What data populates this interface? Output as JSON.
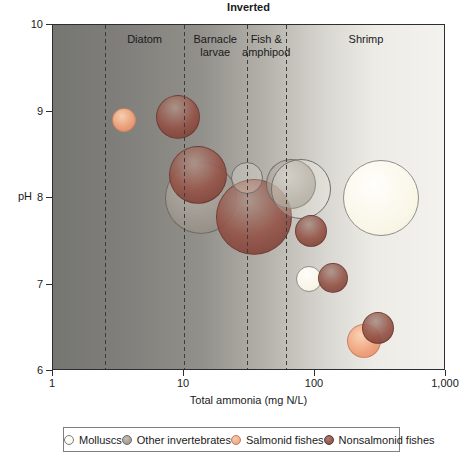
{
  "figure": {
    "title": "Inverted",
    "x_axis": {
      "label": "Total ammonia (mg N/L)",
      "scale": "log",
      "range": [
        1,
        1000
      ],
      "ticks": [
        {
          "value": 1,
          "label": "1"
        },
        {
          "value": 10,
          "label": "10"
        },
        {
          "value": 100,
          "label": "100"
        },
        {
          "value": 1000,
          "label": "1,000"
        }
      ]
    },
    "y_axis": {
      "label": "pH",
      "range": [
        6,
        10
      ],
      "ticks": [
        {
          "value": 10,
          "label": "10"
        },
        {
          "value": 9,
          "label": "9"
        },
        {
          "value": 8,
          "label": "8"
        },
        {
          "value": 7,
          "label": "7"
        },
        {
          "value": 6,
          "label": "6"
        }
      ]
    },
    "legend": {
      "items": [
        {
          "key": "mollusc",
          "label": "Molluscs"
        },
        {
          "key": "other",
          "label": "Other invertebrates"
        },
        {
          "key": "salmonid",
          "label": "Salmonid fishes"
        },
        {
          "key": "nonsalmonid",
          "label": "Nonsalmonid fishes"
        }
      ]
    },
    "colors": {
      "mollusc": "#fdfbef",
      "other": "#a09890",
      "salmonid": "#ee9d76",
      "nonsalmonid": "#8c4a42",
      "background_left": "#757571",
      "background_right": "#f3f2ee",
      "boundary_line": "#3c3c3c"
    }
  },
  "chart_data": {
    "type": "scatter",
    "title": "Inverted",
    "xlabel": "Total ammonia (mg N/L)",
    "ylabel": "pH",
    "x_scale": "log",
    "xlim": [
      1,
      1000
    ],
    "ylim": [
      6,
      10
    ],
    "grid": false,
    "legend_position": "bottom",
    "region_boundaries": [
      2.5,
      10,
      30,
      60
    ],
    "regions": [
      {
        "label": "Diatom",
        "from": 2.5,
        "to": 10
      },
      {
        "label": "Barnacle larvae",
        "from": 10,
        "to": 30
      },
      {
        "label": "Fish & amphipod",
        "from": 30,
        "to": 60
      },
      {
        "label": "Shrimp",
        "from": 60,
        "to": 1000
      }
    ],
    "series": [
      {
        "name": "Molluscs",
        "key": "mollusc",
        "points": [
          {
            "x": 30,
            "y": 8.23,
            "r_px": 16,
            "outline": true,
            "z": 5
          },
          {
            "x": 78,
            "y": 8.1,
            "r_px": 30,
            "outline": true,
            "z": 6
          },
          {
            "x": 320,
            "y": 8.0,
            "r_px": 38,
            "z": 10
          },
          {
            "x": 90,
            "y": 7.06,
            "r_px": 13,
            "z": 11
          }
        ]
      },
      {
        "name": "Other invertebrates",
        "key": "other",
        "points": [
          {
            "x": 13.5,
            "y": 8.0,
            "r_px": 36,
            "z": 1
          },
          {
            "x": 66,
            "y": 8.16,
            "r_px": 25,
            "z": 4
          }
        ]
      },
      {
        "name": "Salmonid fishes",
        "key": "salmonid",
        "points": [
          {
            "x": 3.5,
            "y": 8.9,
            "r_px": 12,
            "z": 8
          },
          {
            "x": 237,
            "y": 6.35,
            "r_px": 17,
            "z": 13
          }
        ]
      },
      {
        "name": "Nonsalmonid fishes",
        "key": "nonsalmonid",
        "points": [
          {
            "x": 12.8,
            "y": 8.27,
            "r_px": 29,
            "z": 2
          },
          {
            "x": 34,
            "y": 7.78,
            "r_px": 38,
            "z": 3
          },
          {
            "x": 93,
            "y": 7.62,
            "r_px": 16,
            "z": 7
          },
          {
            "x": 9,
            "y": 8.94,
            "r_px": 22,
            "z": 9
          },
          {
            "x": 137,
            "y": 7.08,
            "r_px": 15,
            "z": 12
          },
          {
            "x": 302,
            "y": 6.5,
            "r_px": 16,
            "z": 14
          }
        ]
      }
    ]
  }
}
